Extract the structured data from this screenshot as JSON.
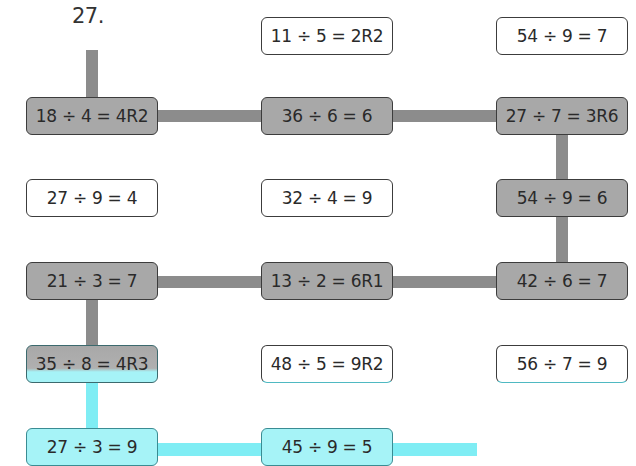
{
  "problem": {
    "number": "27."
  },
  "colors": {
    "path_gray": "#8c8c8c",
    "box_gray": "#a8a8a8",
    "path_cyan": "#7fedf4",
    "box_cyan": "#a6f3f7"
  },
  "grid": {
    "rows": [
      [
        null,
        {
          "text": "11 ÷ 5 = 2R2",
          "on_path": false
        },
        {
          "text": "54 ÷ 9 = 7",
          "on_path": false
        }
      ],
      [
        {
          "text": "18 ÷ 4 = 4R2",
          "on_path": true
        },
        {
          "text": "36 ÷ 6 = 6",
          "on_path": true
        },
        {
          "text": "27 ÷ 7 = 3R6",
          "on_path": true
        }
      ],
      [
        {
          "text": "27 ÷ 9 = 4",
          "on_path": false
        },
        {
          "text": "32 ÷ 4 = 9",
          "on_path": false
        },
        {
          "text": "54 ÷ 9 = 6",
          "on_path": true
        }
      ],
      [
        {
          "text": "21 ÷ 3 = 7",
          "on_path": true
        },
        {
          "text": "13 ÷ 2 = 6R1",
          "on_path": true
        },
        {
          "text": "42 ÷ 6 = 7",
          "on_path": true
        }
      ],
      [
        {
          "text": "35 ÷ 8 = 4R3",
          "on_path": true
        },
        {
          "text": "48 ÷ 5 = 9R2",
          "on_path": false
        },
        {
          "text": "56 ÷ 7 = 9",
          "on_path": false
        }
      ],
      [
        {
          "text": "27 ÷ 3 = 9",
          "on_path": true
        },
        {
          "text": "45 ÷ 9 = 5",
          "on_path": true
        },
        null
      ]
    ]
  }
}
